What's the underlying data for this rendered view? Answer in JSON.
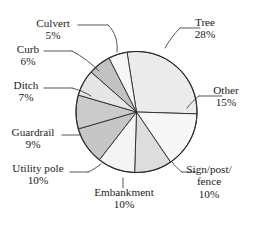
{
  "chart_data": {
    "type": "pie",
    "title": "",
    "subtitle": "",
    "xlabel": "",
    "ylabel": "",
    "legend_position": "none",
    "grid": false,
    "labels_outside": true,
    "leader_lines": true,
    "start_angle_deg": -99,
    "direction": "clockwise",
    "categories": [
      "Tree",
      "Other",
      "Sign/post/fence",
      "Embankment",
      "Utility pole",
      "Guardrail",
      "Ditch",
      "Curb",
      "Culvert"
    ],
    "values": [
      28,
      15,
      10,
      10,
      10,
      9,
      7,
      6,
      5
    ],
    "value_suffix": "%",
    "slices": [
      {
        "label": "Tree",
        "value": 28,
        "value_text": "28%",
        "color": "#ebebeb"
      },
      {
        "label": "Other",
        "value": 15,
        "value_text": "15%",
        "color": "#f7f7f7"
      },
      {
        "label": "Sign/post/fence",
        "value": 10,
        "value_text": "10%",
        "color": "#dddddd"
      },
      {
        "label": "Embankment",
        "value": 10,
        "value_text": "10%",
        "color": "#f4f4f4"
      },
      {
        "label": "Utility pole",
        "value": 10,
        "value_text": "10%",
        "color": "#c6c6c6"
      },
      {
        "label": "Guardrail",
        "value": 9,
        "value_text": "9%",
        "color": "#cbcbcb"
      },
      {
        "label": "Ditch",
        "value": 7,
        "value_text": "7%",
        "color": "#e6e6e6"
      },
      {
        "label": "Curb",
        "value": 6,
        "value_text": "6%",
        "color": "#c2c2c2"
      },
      {
        "label": "Culvert",
        "value": 5,
        "value_text": "5%",
        "color": "#f6f6f6"
      }
    ],
    "outline_color": "#2b2b2b",
    "background": "#ffffff",
    "total": 100
  },
  "labels": {
    "tree": {
      "name": "Tree",
      "pct": "28%"
    },
    "other": {
      "name": "Other",
      "pct": "15%"
    },
    "sign": {
      "name": "Sign/post/",
      "name2": "fence",
      "pct": "10%"
    },
    "embankment": {
      "name": "Embankment",
      "pct": "10%"
    },
    "utility": {
      "name": "Utility pole",
      "pct": "10%"
    },
    "guardrail": {
      "name": "Guardrail",
      "pct": "9%"
    },
    "ditch": {
      "name": "Ditch",
      "pct": "7%"
    },
    "curb": {
      "name": "Curb",
      "pct": "6%"
    },
    "culvert": {
      "name": "Culvert",
      "pct": "5%"
    }
  }
}
